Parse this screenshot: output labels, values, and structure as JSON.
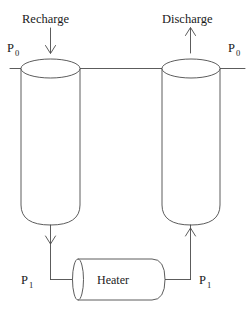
{
  "diagram": {
    "background_color": "#ffffff",
    "line_color": "#4a4a4a",
    "text_color": "#1a1a1a",
    "labels": {
      "recharge": "Recharge",
      "discharge": "Discharge",
      "heater": "Heater",
      "pressure_ambient_left": "P",
      "pressure_ambient_left_sub": "0",
      "pressure_ambient_right": "P",
      "pressure_ambient_right_sub": "0",
      "pressure_high_left": "P",
      "pressure_high_left_sub": "1",
      "pressure_high_right": "P",
      "pressure_high_right_sub": "1"
    },
    "components": [
      {
        "name": "left-vessel",
        "type": "vertical-cylinder",
        "role": "recharge-tank"
      },
      {
        "name": "right-vessel",
        "type": "vertical-cylinder",
        "role": "discharge-tank"
      },
      {
        "name": "heater",
        "type": "horizontal-cylinder",
        "role": "heat-source"
      },
      {
        "name": "top-manifold",
        "type": "line",
        "role": "ambient-pressure-header"
      },
      {
        "name": "bottom-piping",
        "type": "line",
        "role": "high-pressure-loop"
      }
    ],
    "flow_arrows": [
      {
        "name": "recharge-inflow-arrow",
        "direction": "down",
        "at": "top-left"
      },
      {
        "name": "discharge-outflow-arrow",
        "direction": "up",
        "at": "top-right"
      },
      {
        "name": "left-vessel-outlet-arrow",
        "direction": "down",
        "at": "bottom-left"
      },
      {
        "name": "right-vessel-inlet-arrow",
        "direction": "up",
        "at": "bottom-right"
      }
    ]
  }
}
